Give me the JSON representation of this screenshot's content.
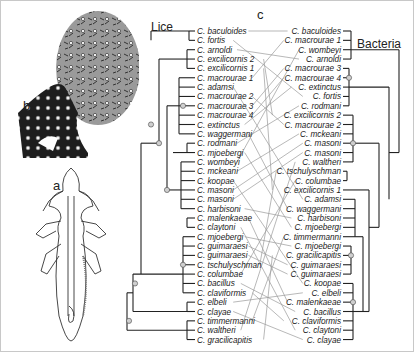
{
  "figure": {
    "panel_labels": {
      "a": "a",
      "b": "b",
      "c": "c"
    },
    "lice_tree": {
      "title": "Lice",
      "taxa": [
        "C. baculoides",
        "C. fortis",
        "C. arnoldi",
        "C. excilicornis 2",
        "C. excilicornis 1",
        "C. macrourae 1",
        "C. adamsi",
        "C. macrourae 2",
        "C. macrourae 3",
        "C. macrourae 4",
        "C. extinctus",
        "C. waggermani",
        "C. rodmani",
        "C. mjoebergi",
        "C. wombeyi",
        "C. mckeani",
        "C. koopae",
        "C. masoni",
        "C. masoni",
        "C. harbisoni",
        "C. malenkaeae",
        "C. claytoni",
        "C. mjoebergi",
        "C. guimaraesi",
        "C. guimaraesi",
        "C. tschulyschman",
        "C. columbae",
        "C. bacillus",
        "C. claviformis",
        "C. elbeli",
        "C. clayae",
        "C. timmermanni",
        "C. waltheri",
        "C. gracilicapitis"
      ]
    },
    "bacteria_tree": {
      "title": "Bacteria",
      "taxa": [
        "C. baculoides",
        "C. macrourae 1",
        "C. wombeyi",
        "C. arnoldi",
        "C. macrourae 3",
        "C. macrourae 4",
        "C. extinctus",
        "C. fortis",
        "C. rodmani",
        "C. excilicornis 2",
        "C. macrourae 2",
        "C. mckeani",
        "C. masoni",
        "C. masoni",
        "C. waltheri",
        "C. tschulyschman",
        "C. columbae",
        "C. excilicornis 1",
        "C. adamsi",
        "C. waggermani",
        "C. harbisoni",
        "C. mjoebergi",
        "C. timmermanni",
        "C. mjoebergi",
        "C. gracilicapitis",
        "C. guimaraesi",
        "C. guimaraesi",
        "C. koopae",
        "C. elbeli",
        "C. malenkaeae",
        "C. bacillus",
        "C. claviformis",
        "C. claytoni",
        "C. clayae"
      ]
    },
    "colors": {
      "tree_line": "#222222",
      "link_line": "#9a9a9a",
      "node_fill": "#cfcfcf"
    }
  }
}
